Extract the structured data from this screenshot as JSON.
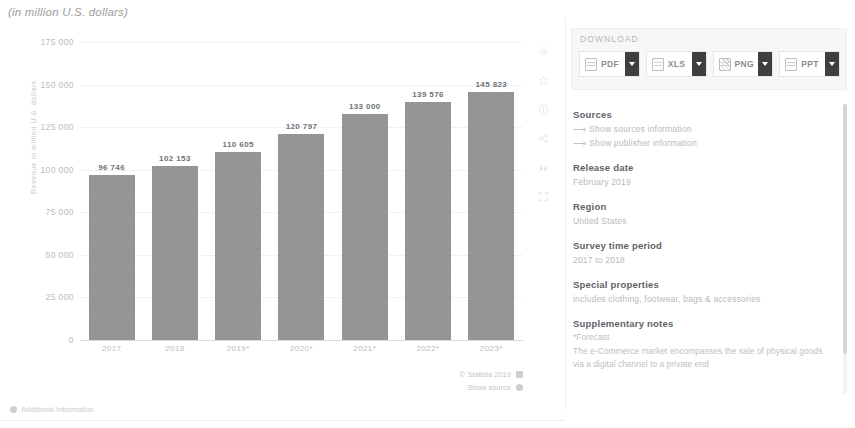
{
  "subtitle": "(in million U.S. dollars)",
  "chart_data": {
    "type": "bar",
    "title": "",
    "subtitle": "(in million U.S. dollars)",
    "xlabel": "",
    "ylabel": "Revenue in million U.S. dollars",
    "categories": [
      "2017",
      "2018",
      "2019*",
      "2020*",
      "2021*",
      "2022*",
      "2023*"
    ],
    "values": [
      96746,
      102153,
      110605,
      120797,
      133000,
      139576,
      145823
    ],
    "value_labels": [
      "96 746",
      "102 153",
      "110 605",
      "120 797",
      "133 000",
      "139 576",
      "145 823"
    ],
    "ylim": [
      0,
      175000
    ],
    "yticks": [
      0,
      25000,
      50000,
      75000,
      100000,
      125000,
      150000,
      175000
    ],
    "ytick_labels": [
      "0",
      "25 000",
      "50 000",
      "75 000",
      "100 000",
      "125 000",
      "150 000",
      "175 000"
    ],
    "grid": true,
    "legend": "none",
    "bar_color": "#8d8d8d"
  },
  "chart_footer": {
    "copyright": "© Statista 2019",
    "show_source": "Show source"
  },
  "additional_information": "Additional Information",
  "icon_rail": [
    {
      "name": "settings-icon"
    },
    {
      "name": "star-icon"
    },
    {
      "name": "info-icon"
    },
    {
      "name": "share-icon"
    },
    {
      "name": "quote-icon"
    },
    {
      "name": "expand-icon"
    }
  ],
  "download": {
    "label": "DOWNLOAD",
    "buttons": [
      {
        "label": "PDF",
        "icon": "pdf-file-icon"
      },
      {
        "label": "XLS",
        "icon": "xls-file-icon"
      },
      {
        "label": "PNG",
        "icon": "png-file-icon"
      },
      {
        "label": "PPT",
        "icon": "ppt-file-icon"
      }
    ]
  },
  "meta": {
    "sources_heading": "Sources",
    "show_sources_link": "Show sources information",
    "show_publisher_link": "Show publisher information",
    "release_date_heading": "Release date",
    "release_date_value": "February 2019",
    "region_heading": "Region",
    "region_value": "United States",
    "survey_heading": "Survey time period",
    "survey_value": "2017 to 2018",
    "special_heading": "Special properties",
    "special_value": "includes clothing, footwear, bags & accessories",
    "notes_heading": "Supplementary notes",
    "notes_forecast": "*Forecast",
    "notes_body": "The e-Commerce market encompasses the sale of physical goods via a digital channel to a private end"
  },
  "colors": {
    "bar": "#8d8d8d",
    "caret": "#3f3f3f",
    "heading": "#5f6367",
    "muted": "#b7babd"
  }
}
